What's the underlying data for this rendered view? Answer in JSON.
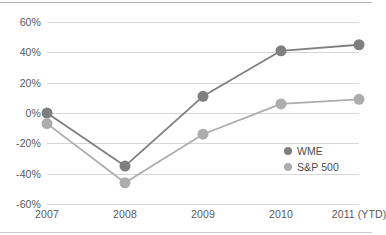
{
  "chart_data": {
    "type": "line",
    "title": "",
    "subtitle": "",
    "xlabel": "",
    "ylabel": "",
    "categories": [
      "2007",
      "2008",
      "2009",
      "2010",
      "2011 (YTD)"
    ],
    "series": [
      {
        "name": "WME",
        "color": "#7f7f7f",
        "values": [
          0,
          -35,
          11,
          41,
          45
        ]
      },
      {
        "name": "S&P 500",
        "color": "#adadad",
        "values": [
          -7,
          -46,
          -14,
          6,
          9
        ]
      }
    ],
    "ylim": [
      -60,
      60
    ],
    "ytick_step": 20,
    "ytick_labels": [
      "60%",
      "40%",
      "20%",
      "0%",
      "-20%",
      "-40%",
      "-60%"
    ],
    "ytick_values": [
      60,
      40,
      20,
      0,
      -20,
      -40,
      -60
    ],
    "grid": "horizontal",
    "legend_position": "inside-lower-right",
    "marker": "circle",
    "marker_size": 11,
    "colors": {
      "gridline": "#d6d6d6",
      "frame": "#b3b3b3",
      "tick_text": "#595959",
      "legend_text": "#4d4d4d",
      "background": "#ffffff"
    }
  },
  "legend": {
    "items": [
      {
        "label": "WME",
        "color": "#7f7f7f"
      },
      {
        "label": "S&P 500",
        "color": "#adadad"
      }
    ]
  }
}
